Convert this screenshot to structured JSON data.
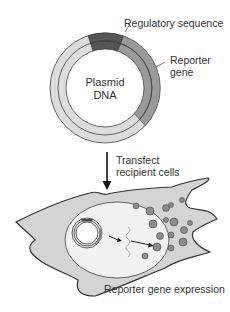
{
  "plasmid": {
    "center_label_line1": "Plasmid",
    "center_label_line2": "DNA",
    "regulatory_label": "Regulatory sequence",
    "reporter_label_line1": "Reporter",
    "reporter_label_line2": "gene"
  },
  "step": {
    "label_line1": "Transfect",
    "label_line2": "recipient cells"
  },
  "cell": {
    "caption": "Reporter gene expression"
  },
  "colors": {
    "regulatory": "#555555",
    "reporter": "#999999",
    "plasmid_ring": "#dddddd",
    "cell_fill": "#d4d4d4",
    "protein": "#888888"
  }
}
